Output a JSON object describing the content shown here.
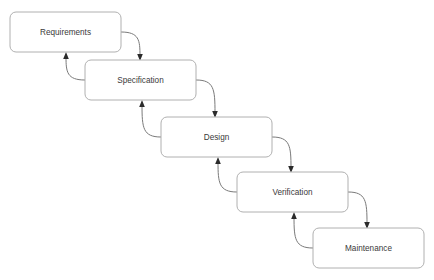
{
  "diagram": {
    "type": "waterfall-model",
    "background_color": "#ffffff",
    "box_border_color": "#b0b0b0",
    "box_fill_color": "#ffffff",
    "label_color": "#3a3a3a",
    "arrow_color": "#7a7a7a",
    "arrowhead_color": "#2b2b2b",
    "stages": [
      {
        "id": "requirements",
        "label": "Requirements",
        "x": 10,
        "y": 12,
        "w": 111,
        "h": 40
      },
      {
        "id": "specification",
        "label": "Specification",
        "x": 85,
        "y": 60,
        "w": 111,
        "h": 40
      },
      {
        "id": "design",
        "label": "Design",
        "x": 161,
        "y": 117,
        "w": 111,
        "h": 40
      },
      {
        "id": "verification",
        "label": "Verification",
        "x": 237,
        "y": 172,
        "w": 111,
        "h": 40
      },
      {
        "id": "maintenance",
        "label": "Maintenance",
        "x": 313,
        "y": 228,
        "w": 111,
        "h": 40
      }
    ],
    "connections": [
      {
        "from": "requirements",
        "to": "specification",
        "direction": "forward"
      },
      {
        "from": "specification",
        "to": "requirements",
        "direction": "backward"
      },
      {
        "from": "specification",
        "to": "design",
        "direction": "forward"
      },
      {
        "from": "design",
        "to": "specification",
        "direction": "backward"
      },
      {
        "from": "design",
        "to": "verification",
        "direction": "forward"
      },
      {
        "from": "verification",
        "to": "design",
        "direction": "backward"
      },
      {
        "from": "verification",
        "to": "maintenance",
        "direction": "forward"
      },
      {
        "from": "maintenance",
        "to": "verification",
        "direction": "backward"
      }
    ]
  },
  "caption": ""
}
